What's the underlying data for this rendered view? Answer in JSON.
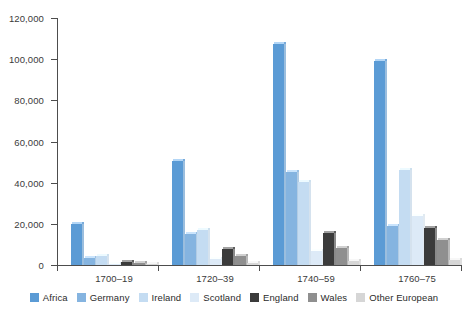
{
  "chart_data": {
    "type": "bar",
    "title": "",
    "subtitle": "",
    "xlabel": "",
    "ylabel": "",
    "categories": [
      "1700–19",
      "1720–39",
      "1740–59",
      "1760–75"
    ],
    "ylim": [
      0,
      120000
    ],
    "ytick_values": [
      0,
      20000,
      40000,
      60000,
      80000,
      100000,
      120000
    ],
    "ytick_labels": [
      "0",
      "20,000",
      "40,000",
      "60,000",
      "80,000",
      "100,000",
      "120,000"
    ],
    "grid": false,
    "legend_position": "bottom",
    "series": [
      {
        "name": "Africa",
        "color": "#5b9bd5",
        "values": [
          19700,
          50400,
          107500,
          99000
        ]
      },
      {
        "name": "Germany",
        "color": "#85b4e0",
        "values": [
          3500,
          15000,
          45000,
          19000
        ]
      },
      {
        "name": "Ireland",
        "color": "#c4dcf2",
        "values": [
          4200,
          17000,
          40500,
          46000
        ]
      },
      {
        "name": "Scotland",
        "color": "#ddeaf7",
        "values": [
          500,
          3000,
          7000,
          24000
        ]
      },
      {
        "name": "England",
        "color": "#3b3b3b",
        "values": [
          1600,
          8000,
          15500,
          18000
        ]
      },
      {
        "name": "Wales",
        "color": "#8f8f8f",
        "values": [
          900,
          4300,
          8500,
          12000
        ]
      },
      {
        "name": "Other European",
        "color": "#d6d6d6",
        "values": [
          300,
          900,
          2000,
          2200
        ]
      }
    ]
  },
  "legend": {
    "items": [
      {
        "label": "Africa"
      },
      {
        "label": "Germany"
      },
      {
        "label": "Ireland"
      },
      {
        "label": "Scotland"
      },
      {
        "label": "England"
      },
      {
        "label": "Wales"
      },
      {
        "label": "Other European"
      }
    ]
  }
}
